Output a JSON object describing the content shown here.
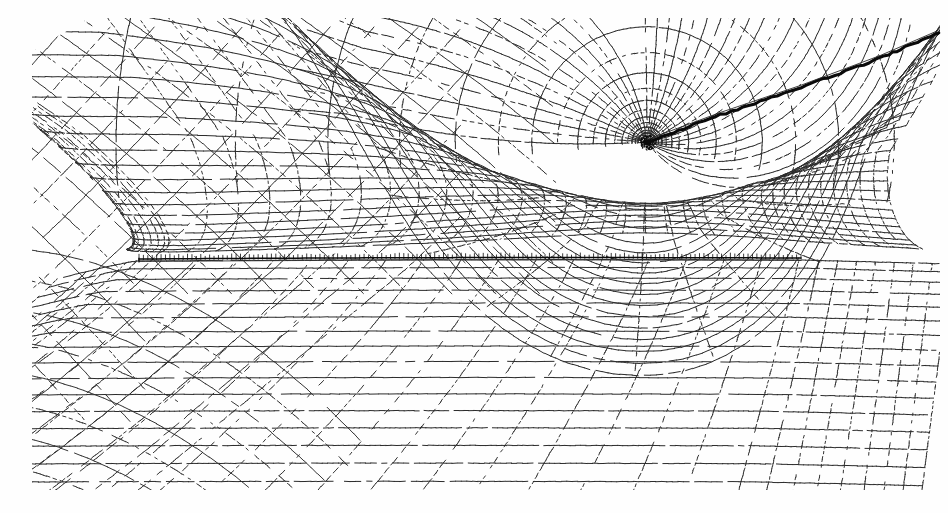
{
  "figure": {
    "title": "Body-fitted computational mesh about a slender plate with singular point and shock",
    "kind": "cfd-grid-plot",
    "width": 948,
    "height": 513,
    "background_color": "#fefefe",
    "ink_color": "#2b2b2b",
    "heavy_ink_color": "#0a0a0a"
  },
  "chart_data": {
    "type": "line",
    "title": "Body-fitted computational mesh about a slender plate with singular point and shock",
    "subtitle": "",
    "xlabel": "",
    "ylabel": "",
    "grid": true,
    "legend_position": "none",
    "tick_labels_x": [],
    "tick_labels_y": [],
    "xlim": [
      0,
      948
    ],
    "ylim": [
      0,
      513
    ],
    "annotations": [
      {
        "name": "singular-point",
        "label": "",
        "x": 647,
        "y": 142,
        "description": "grid collapse / focal point where radial families converge"
      },
      {
        "name": "leading-edge",
        "label": "",
        "x": 139,
        "y": 259,
        "description": "leading edge of the plate"
      },
      {
        "name": "trailing-edge",
        "label": "",
        "x": 801,
        "y": 258,
        "description": "trailing edge of the plate"
      }
    ],
    "series": [
      {
        "name": "body-surface",
        "style": "heavy-solid",
        "values": [
          [
            139,
            259
          ],
          [
            300,
            261
          ],
          [
            520,
            262
          ],
          [
            700,
            262
          ],
          [
            801,
            258
          ]
        ]
      },
      {
        "name": "shock-line",
        "style": "heavy-solid",
        "values": [
          [
            647,
            142
          ],
          [
            720,
            115
          ],
          [
            800,
            88
          ],
          [
            880,
            58
          ],
          [
            938,
            33
          ]
        ]
      },
      {
        "name": "outer-boundary-left",
        "style": "solid",
        "values": [
          [
            33,
            48
          ],
          [
            33,
            250
          ],
          [
            33,
            470
          ]
        ]
      }
    ],
    "mesh": {
      "description": "Two transverse curvilinear grid families (solid streamwise lines and dotted normal lines) wrapping a thin plate, collapsing to one singular point above the aft body.",
      "singular_point": [
        647,
        142
      ],
      "radial_ray_count": 34,
      "arc_count": 18,
      "streamwise_line_count": 24,
      "normal_line_count": 42,
      "body_chord_px": 662,
      "mesh_bounds": [
        33,
        20,
        940,
        487
      ],
      "surface_cluster_ticks": 150
    }
  },
  "regions": [
    {
      "name": "upper-left-crosshatch",
      "description": "diagonal crosshatch far-field mesh upstream and above the plate"
    },
    {
      "name": "spider-web",
      "description": "radial/concentric pattern about the singular point"
    },
    {
      "name": "lower-field",
      "description": "smooth streamwise grid beneath the plate"
    },
    {
      "name": "wake-region",
      "description": "grid downstream of the trailing edge"
    }
  ]
}
